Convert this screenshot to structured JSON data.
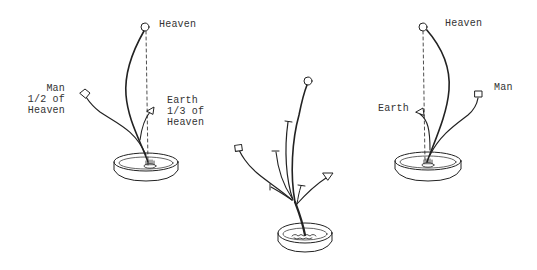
{
  "figures": [
    {
      "id": "left",
      "labels": {
        "heaven": "Heaven",
        "man_lines": [
          "Man",
          "1/2 of",
          "Heaven"
        ],
        "earth_lines": [
          "Earth",
          "1/3 of",
          "Heaven"
        ]
      }
    },
    {
      "id": "middle",
      "labels": {}
    },
    {
      "id": "right",
      "labels": {
        "heaven": "Heaven",
        "man": "Man",
        "earth": "Earth"
      }
    }
  ],
  "colors": {
    "ink": "#222222",
    "text": "#333333",
    "background": "#ffffff"
  }
}
